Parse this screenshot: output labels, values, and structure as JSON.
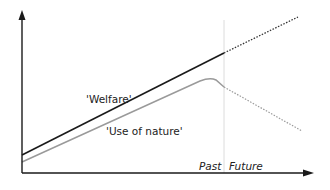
{
  "diagram": {
    "labels": {
      "welfare": "'Welfare'",
      "use_of_nature": "'Use of nature'",
      "past": "Past",
      "future": "Future"
    },
    "colors": {
      "welfare": "#1a1a1a",
      "use_of_nature": "#9a9a9a",
      "divider": "#dcdcdc",
      "axis": "#1a1a1a"
    }
  }
}
